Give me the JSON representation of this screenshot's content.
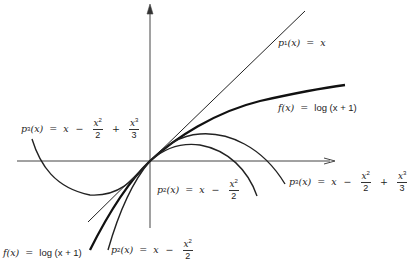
{
  "figure": {
    "origin_px": [
      150,
      161
    ],
    "labels": {
      "p1_upper": {
        "name": "p",
        "sub": "1",
        "arg": "(x)",
        "eq": "=",
        "rhs": "x"
      },
      "f_upper": {
        "name": "f(x)",
        "eq": "=",
        "rhs": "log (x + 1)"
      },
      "p3_left": {
        "name": "p",
        "sub": "3",
        "arg": "(x)",
        "eq": "=",
        "x": "x",
        "minus": "−",
        "frac1_num": "x",
        "frac1_exp": "2",
        "frac1_den": "2",
        "plus": "+",
        "frac2_num": "x",
        "frac2_exp": "3",
        "frac2_den": "3"
      },
      "p2_middle": {
        "name": "p",
        "sub": "2",
        "arg": "(x)",
        "eq": "=",
        "x": "x",
        "minus": "−",
        "frac_num": "x",
        "frac_exp": "2",
        "frac_den": "2"
      },
      "p3_right": {
        "name": "p",
        "sub": "3",
        "arg": "(x)",
        "eq": "=",
        "x": "x",
        "minus": "−",
        "frac1_num": "x",
        "frac1_exp": "2",
        "frac1_den": "2",
        "plus": "+",
        "frac2_num": "x",
        "frac2_exp": "3",
        "frac2_den": "3"
      },
      "f_lower": {
        "name": "f(x)",
        "eq": "=",
        "rhs": "log (x + 1)"
      },
      "p2_lower": {
        "name": "p",
        "sub": "2",
        "arg": "(x)",
        "eq": "=",
        "x": "x",
        "minus": "−",
        "frac_num": "x",
        "frac_exp": "2",
        "frac_den": "2"
      }
    },
    "curves": [
      {
        "id": "p1",
        "formula": "x",
        "style": "thin"
      },
      {
        "id": "f",
        "formula": "log(x+1)",
        "style": "thick"
      },
      {
        "id": "p2",
        "formula": "x - x^2/2",
        "style": "medium"
      },
      {
        "id": "p3",
        "formula": "x - x^2/2 + x^3/3",
        "style": "medium"
      }
    ]
  }
}
